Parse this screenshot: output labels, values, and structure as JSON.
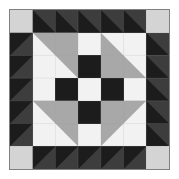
{
  "image": {
    "kind": "quilt-block-diagram",
    "title": "Pieced Quilt Block",
    "width": 179,
    "height": 179,
    "background": "#ffffff"
  },
  "palette": {
    "white": "#f2f2f2",
    "light_gray": "#d4d4d4",
    "mid_gray": "#a8a8a8",
    "dark_gray": "#3d3d3d",
    "black": "#1c1c1c",
    "frame_border": "#808080",
    "seam_line": "#9a9a9a"
  },
  "frame": {
    "x": 9,
    "y": 9,
    "size": 161,
    "border_color": "#808080",
    "border_width": 1
  },
  "grid": {
    "columns": 7,
    "rows": 7,
    "unit_px": 23
  },
  "chart_data": {
    "type": "heatmap",
    "xlabel": "",
    "ylabel": "",
    "categories": [
      "c1",
      "c2",
      "c3",
      "c4",
      "c5",
      "c6",
      "c7"
    ],
    "rows": [
      "r1",
      "r2",
      "r3",
      "r4",
      "r5",
      "r6",
      "r7"
    ],
    "legend": [
      {
        "name": "white",
        "color": "#f2f2f2"
      },
      {
        "name": "light-gray",
        "color": "#d4d4d4"
      },
      {
        "name": "mid-gray",
        "color": "#a8a8a8"
      },
      {
        "name": "dark-gray",
        "color": "#3d3d3d"
      },
      {
        "name": "black",
        "color": "#1c1c1c"
      }
    ],
    "cells": [
      {
        "r": 0,
        "c": 0,
        "type": "solid",
        "fill": "#d4d4d4",
        "name": "corner-light-square"
      },
      {
        "r": 0,
        "c": 1,
        "type": "hst",
        "orient": "tl-br",
        "a": "#3d3d3d",
        "b": "#1c1c1c",
        "name": "border-hst"
      },
      {
        "r": 0,
        "c": 2,
        "type": "hst",
        "orient": "tl-br",
        "a": "#3d3d3d",
        "b": "#1c1c1c",
        "name": "border-hst"
      },
      {
        "r": 0,
        "c": 3,
        "type": "hst",
        "orient": "tl-br",
        "a": "#3d3d3d",
        "b": "#1c1c1c",
        "name": "border-hst"
      },
      {
        "r": 0,
        "c": 4,
        "type": "hst",
        "orient": "tl-br",
        "a": "#3d3d3d",
        "b": "#1c1c1c",
        "name": "border-hst"
      },
      {
        "r": 0,
        "c": 5,
        "type": "hst",
        "orient": "tl-br",
        "a": "#3d3d3d",
        "b": "#1c1c1c",
        "name": "border-hst"
      },
      {
        "r": 0,
        "c": 6,
        "type": "solid",
        "fill": "#d4d4d4",
        "name": "corner-light-square"
      },
      {
        "r": 1,
        "c": 0,
        "type": "hst",
        "orient": "tr-bl",
        "a": "#1c1c1c",
        "b": "#3d3d3d",
        "name": "border-hst"
      },
      {
        "r": 1,
        "c": 6,
        "type": "hst",
        "orient": "tl-br",
        "a": "#3d3d3d",
        "b": "#1c1c1c",
        "name": "border-hst"
      },
      {
        "r": 2,
        "c": 0,
        "type": "hst",
        "orient": "tr-bl",
        "a": "#1c1c1c",
        "b": "#3d3d3d",
        "name": "border-hst"
      },
      {
        "r": 2,
        "c": 6,
        "type": "hst",
        "orient": "tl-br",
        "a": "#3d3d3d",
        "b": "#1c1c1c",
        "name": "border-hst"
      },
      {
        "r": 3,
        "c": 0,
        "type": "hst",
        "orient": "tr-bl",
        "a": "#1c1c1c",
        "b": "#3d3d3d",
        "name": "border-hst"
      },
      {
        "r": 3,
        "c": 6,
        "type": "hst",
        "orient": "tl-br",
        "a": "#3d3d3d",
        "b": "#1c1c1c",
        "name": "border-hst"
      },
      {
        "r": 4,
        "c": 0,
        "type": "hst",
        "orient": "tr-bl",
        "a": "#1c1c1c",
        "b": "#3d3d3d",
        "name": "border-hst"
      },
      {
        "r": 4,
        "c": 6,
        "type": "hst",
        "orient": "tl-br",
        "a": "#3d3d3d",
        "b": "#1c1c1c",
        "name": "border-hst"
      },
      {
        "r": 5,
        "c": 0,
        "type": "hst",
        "orient": "tr-bl",
        "a": "#1c1c1c",
        "b": "#3d3d3d",
        "name": "border-hst"
      },
      {
        "r": 5,
        "c": 6,
        "type": "hst",
        "orient": "tl-br",
        "a": "#3d3d3d",
        "b": "#1c1c1c",
        "name": "border-hst"
      },
      {
        "r": 6,
        "c": 0,
        "type": "solid",
        "fill": "#d4d4d4",
        "name": "corner-light-square"
      },
      {
        "r": 6,
        "c": 1,
        "type": "hst",
        "orient": "tr-bl",
        "a": "#1c1c1c",
        "b": "#3d3d3d",
        "name": "border-hst"
      },
      {
        "r": 6,
        "c": 2,
        "type": "hst",
        "orient": "tr-bl",
        "a": "#1c1c1c",
        "b": "#3d3d3d",
        "name": "border-hst"
      },
      {
        "r": 6,
        "c": 3,
        "type": "hst",
        "orient": "tr-bl",
        "a": "#1c1c1c",
        "b": "#3d3d3d",
        "name": "border-hst"
      },
      {
        "r": 6,
        "c": 4,
        "type": "hst",
        "orient": "tr-bl",
        "a": "#1c1c1c",
        "b": "#3d3d3d",
        "name": "border-hst"
      },
      {
        "r": 6,
        "c": 5,
        "type": "hst",
        "orient": "tr-bl",
        "a": "#1c1c1c",
        "b": "#3d3d3d",
        "name": "border-hst"
      },
      {
        "r": 6,
        "c": 6,
        "type": "solid",
        "fill": "#d4d4d4",
        "name": "corner-light-square"
      }
    ],
    "center_block": {
      "origin_col": 1,
      "origin_row": 1,
      "columns": 5,
      "rows": 5,
      "unit_px": 23,
      "cells": [
        {
          "r": 0,
          "c": 0,
          "type": "hst2",
          "orient": "tr",
          "base": "#f2f2f2",
          "tri": "#a8a8a8",
          "span": 2,
          "name": "corner-flying-geese"
        },
        {
          "r": 0,
          "c": 2,
          "type": "solid",
          "fill": "#f2f2f2",
          "name": "center-white"
        },
        {
          "r": 0,
          "c": 3,
          "type": "hst2",
          "orient": "bl",
          "base": "#f2f2f2",
          "tri": "#a8a8a8",
          "span": 2,
          "name": "corner-flying-geese"
        },
        {
          "r": 1,
          "c": 2,
          "type": "solid",
          "fill": "#1c1c1c",
          "name": "center-black"
        },
        {
          "r": 2,
          "c": 0,
          "type": "solid",
          "fill": "#f2f2f2",
          "name": "center-white"
        },
        {
          "r": 2,
          "c": 1,
          "type": "solid",
          "fill": "#1c1c1c",
          "name": "center-black"
        },
        {
          "r": 2,
          "c": 2,
          "type": "solid",
          "fill": "#f2f2f2",
          "name": "center-white"
        },
        {
          "r": 2,
          "c": 3,
          "type": "solid",
          "fill": "#1c1c1c",
          "name": "center-black"
        },
        {
          "r": 2,
          "c": 4,
          "type": "solid",
          "fill": "#f2f2f2",
          "name": "center-white"
        },
        {
          "r": 3,
          "c": 0,
          "type": "hst2",
          "orient": "tr",
          "base": "#f2f2f2",
          "tri": "#a8a8a8",
          "span": 2,
          "name": "corner-flying-geese"
        },
        {
          "r": 3,
          "c": 2,
          "type": "solid",
          "fill": "#1c1c1c",
          "name": "center-black"
        },
        {
          "r": 3,
          "c": 3,
          "type": "hst2",
          "orient": "tl",
          "base": "#f2f2f2",
          "tri": "#a8a8a8",
          "span": 2,
          "name": "corner-flying-geese"
        },
        {
          "r": 4,
          "c": 2,
          "type": "solid",
          "fill": "#f2f2f2",
          "name": "center-white"
        }
      ]
    }
  }
}
